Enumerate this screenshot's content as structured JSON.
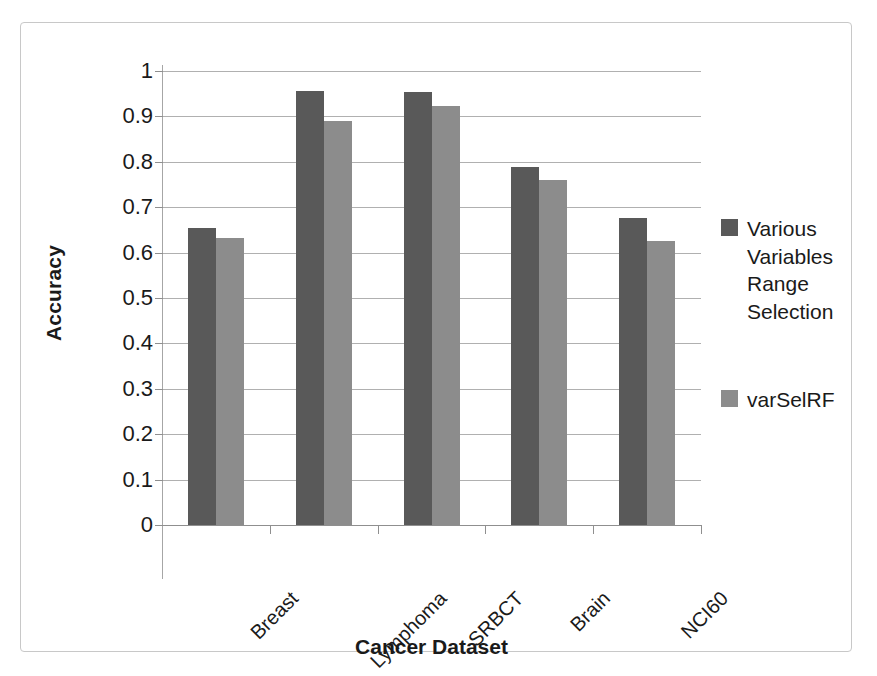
{
  "chart_data": {
    "type": "bar",
    "title": "",
    "xlabel": "Cancer Dataset",
    "ylabel": "Accuracy",
    "categories": [
      "Breast",
      "Lymphoma",
      "SRBCT",
      "Brain",
      "NCI60"
    ],
    "series": [
      {
        "name": "Various Variables Range Selection",
        "color": "#595959",
        "values": [
          0.655,
          0.955,
          0.953,
          0.788,
          0.676
        ]
      },
      {
        "name": "varSelRF",
        "color": "#8c8c8c",
        "values": [
          0.632,
          0.891,
          0.923,
          0.76,
          0.626
        ]
      }
    ],
    "ylim": [
      0,
      1
    ],
    "yticks": [
      "0",
      "0.1",
      "0.2",
      "0.3",
      "0.4",
      "0.5",
      "0.6",
      "0.7",
      "0.8",
      "0.9",
      "1"
    ],
    "ytick_values": [
      0,
      0.1,
      0.2,
      0.3,
      0.4,
      0.5,
      0.6,
      0.7,
      0.8,
      0.9,
      1
    ],
    "grid": true,
    "legend_position": "right",
    "xlabel_rotation": -45
  },
  "legend": {
    "entries": [
      {
        "label": "Various Variables Range Selection",
        "color": "#595959"
      },
      {
        "label": "varSelRF",
        "color": "#8c8c8c"
      }
    ]
  },
  "axes": {
    "y_title": "Accuracy",
    "x_title": "Cancer Dataset"
  }
}
